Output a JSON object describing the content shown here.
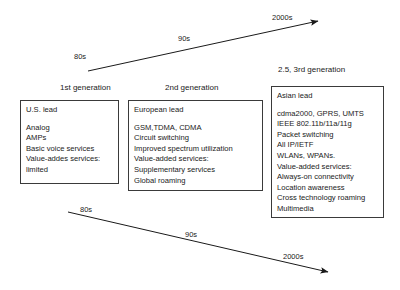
{
  "diagram": {
    "title_hidden": "Mobile communications generations timeline",
    "top_timeline": {
      "name": "upward-timeline-arrow",
      "labels": [
        {
          "text": "80s",
          "x": 74,
          "y": 53
        },
        {
          "text": "90s",
          "x": 178,
          "y": 35
        },
        {
          "text": "2000s",
          "x": 272,
          "y": 14
        }
      ],
      "line": {
        "x1": 88,
        "y1": 71,
        "x2": 318,
        "y2": 21
      }
    },
    "bottom_timeline": {
      "name": "downward-timeline-arrow",
      "labels": [
        {
          "text": "80s",
          "x": 80,
          "y": 206
        },
        {
          "text": "90s",
          "x": 185,
          "y": 231
        },
        {
          "text": "2000s",
          "x": 283,
          "y": 253
        }
      ],
      "line": {
        "x1": 68,
        "y1": 212,
        "x2": 328,
        "y2": 272
      }
    },
    "generation_labels": [
      {
        "text": "1st generation",
        "x": 60,
        "y": 84
      },
      {
        "text": "2nd generation",
        "x": 165,
        "y": 84
      },
      {
        "text": "2.5, 3rd generation",
        "x": 278,
        "y": 66
      }
    ],
    "boxes": [
      {
        "id": "first-generation",
        "title": "U.S. lead",
        "lines": [
          "Analog",
          "AMPs",
          "Basic voice services",
          "Value-addes services:",
          "limited"
        ],
        "x": 20,
        "y": 100,
        "width": 99,
        "height": 84
      },
      {
        "id": "second-generation",
        "title": "European lead",
        "lines": [
          "GSM,TDMA, CDMA",
          "Circuit switching",
          "Improved spectrum utilization",
          "Value-added services:",
          "Supplementary services",
          "Global roaming"
        ],
        "x": 128,
        "y": 100,
        "width": 135,
        "height": 91
      },
      {
        "id": "third-generation",
        "title": "Asian lead",
        "lines": [
          "cdma2000, GPRS, UMTS",
          "IEEE 802.11b/11a/11g",
          "Packet switching",
          "All IP/IETF",
          "WLANs, WPANs.",
          "Value-added services:",
          "Always-on connectivity",
          "Location awareness",
          "Cross technology roaming",
          "Multimedia"
        ],
        "x": 271,
        "y": 86,
        "width": 113,
        "height": 132
      }
    ],
    "colors": {
      "background": "#ffffff",
      "ink": "#1a1a1a",
      "border": "#3a3a3a"
    }
  }
}
